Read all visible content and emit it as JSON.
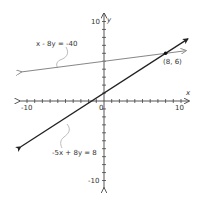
{
  "chart_data": {
    "type": "line",
    "title": "",
    "xlabel": "x",
    "ylabel": "y",
    "xlim": [
      -10,
      10
    ],
    "ylim": [
      -10,
      10
    ],
    "x_tick_labels": [
      "-10",
      "0",
      "10"
    ],
    "y_tick_labels": [
      "10",
      "-10"
    ],
    "tick_step": 1,
    "grid": false,
    "series": [
      {
        "name": "x - 8y = -40",
        "equation": "x - 8y = -40",
        "slope": 0.125,
        "intercept": 5,
        "color": "#888888",
        "x": [
          -10.8,
          10.6
        ],
        "y": [
          3.65,
          6.33
        ]
      },
      {
        "name": "-5x + 8y = 8",
        "equation": "-5x + 8y = 8",
        "slope": 0.625,
        "intercept": 1,
        "color": "#222222",
        "x": [
          -10.8,
          10.9
        ],
        "y": [
          -5.75,
          7.81
        ]
      }
    ],
    "annotations": [
      {
        "text": "(8, 6)",
        "x": 8,
        "y": 6,
        "type": "intersection-point"
      }
    ]
  },
  "labels": {
    "x_axis": "x",
    "y_axis": "y",
    "x_min": "-10",
    "x_zero": "0",
    "x_max": "10",
    "y_max": "10",
    "y_min": "-10",
    "line1": "x - 8y = -40",
    "line2": "-5x + 8y = 8",
    "point": "(8, 6)"
  }
}
